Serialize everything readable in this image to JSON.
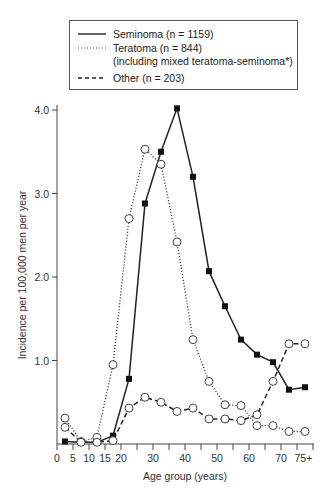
{
  "panel_label": "",
  "legend": {
    "items": [
      {
        "label": "Seminoma (n = 1159)",
        "style": "solid"
      },
      {
        "label": "Teratoma (n = 844)",
        "style": "dotted"
      },
      {
        "label": "Other (n = 203)",
        "style": "dashed"
      }
    ],
    "teratoma_sub": "(including mixed teratoma-seminoma*)"
  },
  "axes": {
    "xlabel": "Age group (years)",
    "ylabel": "Incidence per 100,000 men per year",
    "yticks": [
      "4.0",
      "3.0",
      "2.0",
      "1.0"
    ],
    "xticks": [
      "0",
      "5",
      "10",
      "15",
      "20",
      "30",
      "40",
      "50",
      "60",
      "70",
      "75+"
    ]
  },
  "chart_data": {
    "type": "line",
    "title": "",
    "xlabel": "Age group (years)",
    "ylabel": "Incidence per 100,000 men per year",
    "ylim": [
      0,
      4.0
    ],
    "xlim": [
      0,
      80
    ],
    "x": [
      2.5,
      7.5,
      12.5,
      17.5,
      22.5,
      27.5,
      32.5,
      37.5,
      42.5,
      47.5,
      52.5,
      57.5,
      62.5,
      67.5,
      72.5,
      77.5
    ],
    "categories": [
      "0-4",
      "5-9",
      "10-14",
      "15-19",
      "20-24",
      "25-29",
      "30-34",
      "35-39",
      "40-44",
      "45-49",
      "50-54",
      "55-59",
      "60-64",
      "65-69",
      "70-74",
      "75+"
    ],
    "series": [
      {
        "name": "Seminoma (n = 1159)",
        "style": "solid",
        "marker": "filled-square",
        "values": [
          0.03,
          0.02,
          0.02,
          0.1,
          0.78,
          2.88,
          3.5,
          4.02,
          3.2,
          2.07,
          1.65,
          1.25,
          1.07,
          0.98,
          0.65,
          0.68
        ]
      },
      {
        "name": "Teratoma (n = 844)",
        "style": "dotted",
        "marker": "open-circle",
        "values": [
          0.31,
          0.03,
          0.08,
          0.95,
          2.7,
          3.53,
          3.35,
          2.42,
          1.25,
          0.75,
          0.47,
          0.46,
          0.22,
          0.22,
          0.15,
          0.15
        ]
      },
      {
        "name": "Other (n = 203)",
        "style": "dashed",
        "marker": "open-circle",
        "values": [
          0.2,
          0.02,
          0.02,
          0.04,
          0.43,
          0.56,
          0.5,
          0.39,
          0.43,
          0.3,
          0.3,
          0.28,
          0.35,
          0.75,
          1.2,
          1.2
        ]
      }
    ],
    "grid": false,
    "legend_position": "top"
  }
}
